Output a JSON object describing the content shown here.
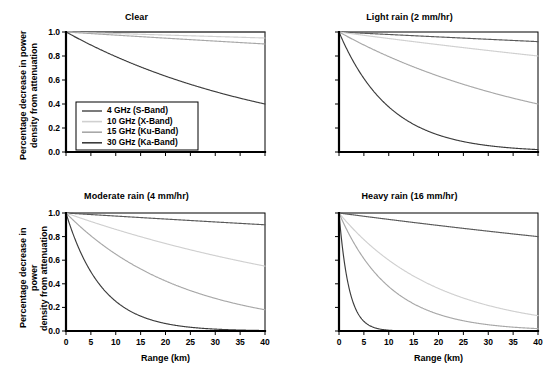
{
  "chart_data": {
    "type": "line",
    "layout": "2x2 grid of small-multiple line plots",
    "xlabel": "Range (km)",
    "ylabel": "Percentage decrease in power\ndensity from attenuation",
    "xlim": [
      0,
      40
    ],
    "ylim": [
      0,
      1.0
    ],
    "xticks": [
      0,
      5,
      10,
      15,
      20,
      25,
      30,
      35,
      40
    ],
    "yticks": [
      "0.0",
      "0.2",
      "0.4",
      "0.6",
      "0.8",
      "1.0"
    ],
    "ytick_values": [
      0.0,
      0.2,
      0.4,
      0.6,
      0.8,
      1.0
    ],
    "grid": false,
    "legend_position": "inside top-left panel, lower-left",
    "legend_panel": "Clear",
    "series_names": [
      "4 GHz (S-Band)",
      "10 GHz (X-Band)",
      "15 GHz (Ku-Band)",
      "30 GHz (Ka-Band)"
    ],
    "series_colors": [
      "#5a5a5a",
      "#d0d0d0",
      "#a8a8a8",
      "#3c3c3c"
    ],
    "model": "exponential decay y = exp(-k * range)",
    "panels": [
      {
        "id": "clear",
        "title": "Clear",
        "row": 0,
        "col": 0,
        "series": [
          {
            "name": "4 GHz (S-Band)",
            "y_at_40km": 1.0,
            "k": 0.0
          },
          {
            "name": "10 GHz (X-Band)",
            "y_at_40km": 0.95,
            "k": 0.00128
          },
          {
            "name": "15 GHz (Ku-Band)",
            "y_at_40km": 0.9,
            "k": 0.00263
          },
          {
            "name": "30 GHz (Ka-Band)",
            "y_at_40km": 0.4,
            "k": 0.02291
          }
        ]
      },
      {
        "id": "light-rain",
        "title": "Light rain (2 mm/hr)",
        "row": 0,
        "col": 1,
        "series": [
          {
            "name": "4 GHz (S-Band)",
            "y_at_40km": 0.92,
            "k": 0.00209
          },
          {
            "name": "10 GHz (X-Band)",
            "y_at_40km": 0.8,
            "k": 0.00558
          },
          {
            "name": "15 GHz (Ku-Band)",
            "y_at_40km": 0.4,
            "k": 0.02291
          },
          {
            "name": "30 GHz (Ka-Band)",
            "y_at_40km": 0.02,
            "k": 0.0978
          }
        ]
      },
      {
        "id": "moderate-rain",
        "title": "Moderate rain (4 mm/hr)",
        "row": 1,
        "col": 0,
        "series": [
          {
            "name": "4 GHz (S-Band)",
            "y_at_40km": 0.9,
            "k": 0.00263
          },
          {
            "name": "10 GHz (X-Band)",
            "y_at_40km": 0.55,
            "k": 0.01495
          },
          {
            "name": "15 GHz (Ku-Band)",
            "y_at_40km": 0.18,
            "k": 0.04287
          },
          {
            "name": "30 GHz (Ka-Band)",
            "y_at_40km": 0.004,
            "k": 0.138
          }
        ]
      },
      {
        "id": "heavy-rain",
        "title": "Heavy rain (16 mm/hr)",
        "row": 1,
        "col": 1,
        "series": [
          {
            "name": "4 GHz (S-Band)",
            "y_at_40km": 0.8,
            "k": 0.00558
          },
          {
            "name": "10 GHz (X-Band)",
            "y_at_40km": 0.13,
            "k": 0.051
          },
          {
            "name": "15 GHz (Ku-Band)",
            "y_at_40km": 0.02,
            "k": 0.0978
          },
          {
            "name": "30 GHz (Ka-Band)",
            "y_at_40km": 0.0001,
            "k": 0.5
          }
        ]
      }
    ]
  }
}
